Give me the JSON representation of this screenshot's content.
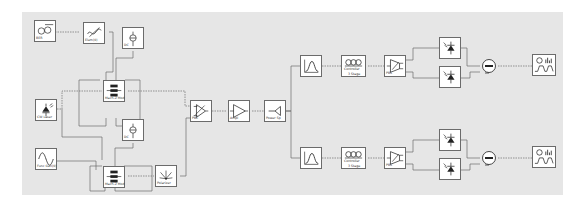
{
  "diagram": {
    "type": "optical-system-layout",
    "background": "#e6e6e6",
    "blocks": {
      "prbs": {
        "label": "BER",
        "icon": "prbs-generator-icon"
      },
      "ws": {
        "label": "Elem(0)",
        "icon": "wavelength-selector-icon"
      },
      "dc_top": {
        "label": "DC",
        "icon": "dc-source-icon"
      },
      "cw_laser": {
        "label": "CW Laser",
        "icon": "laser-icon"
      },
      "mzm_top": {
        "label": "Mach-Z Mod",
        "icon": "mzm-modulator-icon"
      },
      "dc_bottom": {
        "label": "DC",
        "icon": "dc-source-icon"
      },
      "func_gen": {
        "label": "Func Gen(0)",
        "icon": "sine-generator-icon"
      },
      "mzm_bottom": {
        "label": "Mach-Z Mod",
        "icon": "mzm-modulator-icon"
      },
      "polarizer": {
        "label": "Polarizer",
        "icon": "polarizer-icon"
      },
      "pbc": {
        "label": "PBC",
        "icon": "polarization-combiner-icon"
      },
      "edfa": {
        "label": "Ampl",
        "icon": "amplifier-icon"
      },
      "splitter": {
        "label": "Power Sp",
        "icon": "power-splitter-icon"
      },
      "filter_top": {
        "label": "",
        "icon": "optical-filter-icon"
      },
      "ctrl_top": {
        "label": "Controller",
        "sublabel": "3 Stage",
        "icon": "polarization-controller-icon"
      },
      "pbs_top": {
        "label": "PBS",
        "icon": "polarization-splitter-icon"
      },
      "pd_top_a": {
        "label": "",
        "icon": "photodiode-icon"
      },
      "pd_top_b": {
        "label": "",
        "icon": "photodiode-icon"
      },
      "sub_top": {
        "label": "",
        "icon": "subtractor-icon"
      },
      "analyzer_top": {
        "label": "",
        "icon": "signal-analyzer-icon"
      },
      "filter_bot": {
        "label": "",
        "icon": "optical-filter-icon"
      },
      "ctrl_bot": {
        "label": "Controller",
        "sublabel": "3 Stage",
        "icon": "polarization-controller-icon"
      },
      "pbs_bot": {
        "label": "PBS",
        "icon": "polarization-splitter-icon"
      },
      "pd_bot_a": {
        "label": "",
        "icon": "photodiode-icon"
      },
      "pd_bot_b": {
        "label": "",
        "icon": "photodiode-icon"
      },
      "sub_bot": {
        "label": "",
        "icon": "subtractor-icon"
      },
      "analyzer_bot": {
        "label": "",
        "icon": "signal-analyzer-icon"
      }
    }
  }
}
